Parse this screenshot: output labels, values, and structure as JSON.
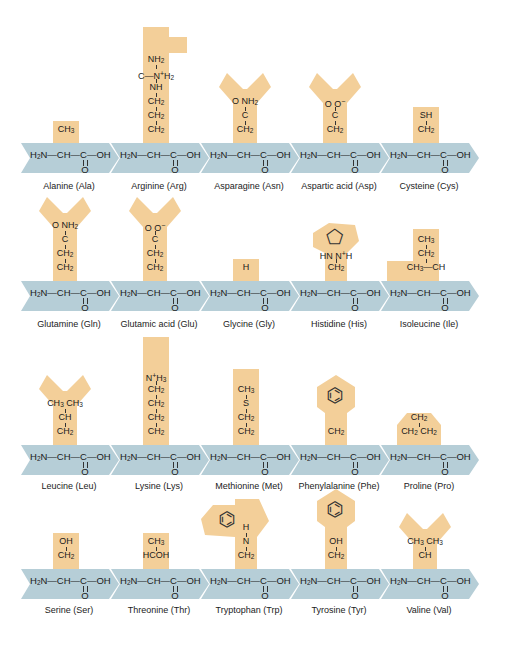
{
  "diagram": {
    "title": "",
    "colors": {
      "side_chain_fill": "#f3cf99",
      "backbone_arrow_fill": "#b6ced7",
      "text": "#1a1a1a"
    },
    "backbone": {
      "left": "H₂N—CH—C—OH",
      "carbonyl": "O"
    },
    "amino_acids": [
      {
        "name": "Alanine (Ala)",
        "side_chain": [
          "CH₃"
        ]
      },
      {
        "name": "Arginine (Arg)",
        "side_chain": [
          "NH₂",
          "C—N⁺H₂",
          "NH",
          "CH₂",
          "CH₂",
          "CH₂"
        ]
      },
      {
        "name": "Asparagine (Asn)",
        "side_chain": [
          "O   NH₂",
          "C",
          "CH₂"
        ]
      },
      {
        "name": "Aspartic acid (Asp)",
        "side_chain": [
          "O   O⁻",
          "C",
          "CH₂"
        ]
      },
      {
        "name": "Cysteine (Cys)",
        "side_chain": [
          "SH",
          "CH₂"
        ]
      },
      {
        "name": "Glutamine (Gln)",
        "side_chain": [
          "O   NH₂",
          "C",
          "CH₂",
          "CH₂"
        ]
      },
      {
        "name": "Glutamic acid (Glu)",
        "side_chain": [
          "O   O⁻",
          "C",
          "CH₂",
          "CH₂"
        ]
      },
      {
        "name": "Glycine (Gly)",
        "side_chain": [
          "H"
        ]
      },
      {
        "name": "Histidine (His)",
        "side_chain": [
          "HN   N⁺H",
          "imidazole-ring",
          "CH₂"
        ]
      },
      {
        "name": "Isoleucine (Ile)",
        "side_chain": [
          "CH₃",
          "CH₂",
          "CH₃—CH"
        ]
      },
      {
        "name": "Leucine (Leu)",
        "side_chain": [
          "CH₃   CH₃",
          "CH",
          "CH₂"
        ]
      },
      {
        "name": "Lysine (Lys)",
        "side_chain": [
          "N⁺H₃",
          "CH₂",
          "CH₂",
          "CH₂",
          "CH₂"
        ]
      },
      {
        "name": "Methionine (Met)",
        "side_chain": [
          "CH₃",
          "S",
          "CH₂",
          "CH₂"
        ]
      },
      {
        "name": "Phenylalanine (Phe)",
        "side_chain": [
          "benzene-ring",
          "CH₂"
        ]
      },
      {
        "name": "Proline (Pro)",
        "side_chain": [
          "CH₂",
          "CH₂  CH₂"
        ]
      },
      {
        "name": "Serine (Ser)",
        "side_chain": [
          "OH",
          "CH₂"
        ]
      },
      {
        "name": "Threonine (Thr)",
        "side_chain": [
          "CH₃",
          "HCOH"
        ]
      },
      {
        "name": "Tryptophan (Trp)",
        "side_chain": [
          "H",
          "N",
          "indole-ring",
          "CH₂"
        ]
      },
      {
        "name": "Tyrosine (Tyr)",
        "side_chain": [
          "OH",
          "phenol-ring",
          "CH₂"
        ]
      },
      {
        "name": "Valine (Val)",
        "side_chain": [
          "CH₃   CH₃",
          "CH"
        ]
      }
    ]
  }
}
